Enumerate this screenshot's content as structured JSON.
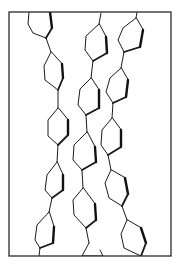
{
  "diagram": {
    "type": "molecular-packing",
    "frame": {
      "x": 9,
      "y": 12,
      "width": 162,
      "height": 244
    },
    "colors": {
      "background": "#ffffff",
      "line": "#1c1c1c"
    },
    "chains": [
      {
        "name": "left-chain",
        "rings": [
          [
            [
              29,
              12
            ],
            [
              28,
              24
            ],
            [
              33,
              33
            ],
            [
              46,
              38
            ],
            [
              52,
              28
            ],
            [
              50,
              12
            ]
          ],
          [
            [
              51,
              52
            ],
            [
              44,
              66
            ],
            [
              45,
              80
            ],
            [
              58,
              90
            ],
            [
              63,
              78
            ],
            [
              62,
              64
            ]
          ],
          [
            [
              58,
              108
            ],
            [
              48,
              120
            ],
            [
              48,
              136
            ],
            [
              58,
              145
            ],
            [
              68,
              135
            ],
            [
              68,
              120
            ]
          ],
          [
            [
              57,
              162
            ],
            [
              47,
              175
            ],
            [
              45,
              190
            ],
            [
              52,
              198
            ],
            [
              63,
              190
            ],
            [
              63,
              175
            ]
          ],
          [
            [
              49,
              212
            ],
            [
              37,
              225
            ],
            [
              35,
              240
            ],
            [
              40,
              248
            ],
            [
              53,
              243
            ],
            [
              54,
              227
            ]
          ]
        ],
        "bonds": [
          [
            [
              46,
              38
            ],
            [
              51,
              52
            ]
          ],
          [
            [
              58,
              90
            ],
            [
              58,
              108
            ]
          ],
          [
            [
              58,
              145
            ],
            [
              57,
              162
            ]
          ],
          [
            [
              52,
              198
            ],
            [
              49,
              212
            ]
          ],
          [
            [
              40,
              248
            ],
            [
              39,
              256
            ]
          ]
        ]
      },
      {
        "name": "middle-chain",
        "rings": [
          [
            [
              99,
              24
            ],
            [
              86,
              36
            ],
            [
              85,
              50
            ],
            [
              93,
              61
            ],
            [
              107,
              53
            ],
            [
              106,
              37
            ]
          ],
          [
            [
              91,
              78
            ],
            [
              80,
              89
            ],
            [
              78,
              105
            ],
            [
              86,
              115
            ],
            [
              99,
              108
            ],
            [
              99,
              90
            ]
          ],
          [
            [
              87,
              132
            ],
            [
              74,
              145
            ],
            [
              73,
              160
            ],
            [
              82,
              170
            ],
            [
              96,
              162
            ],
            [
              95,
              147
            ]
          ],
          [
            [
              83,
              188
            ],
            [
              73,
              200
            ],
            [
              74,
              215
            ],
            [
              86,
              228
            ],
            [
              96,
              220
            ],
            [
              95,
              204
            ]
          ],
          [
            [
              89,
              243
            ],
            [
              82,
              256
            ],
            [
              103,
              256
            ],
            [
              100,
              250
            ]
          ]
        ],
        "bonds": [
          [
            [
              101,
              13
            ],
            [
              99,
              24
            ]
          ],
          [
            [
              93,
              61
            ],
            [
              91,
              78
            ]
          ],
          [
            [
              86,
              115
            ],
            [
              87,
              132
            ]
          ],
          [
            [
              82,
              170
            ],
            [
              83,
              188
            ]
          ],
          [
            [
              86,
              228
            ],
            [
              89,
              243
            ]
          ]
        ]
      },
      {
        "name": "right-chain",
        "rings": [
          [
            [
              136,
              18
            ],
            [
              123,
              28
            ],
            [
              118,
              40
            ],
            [
              124,
              52
            ],
            [
              140,
              47
            ],
            [
              143,
              30
            ]
          ],
          [
            [
              121,
              68
            ],
            [
              110,
              78
            ],
            [
              106,
              92
            ],
            [
              113,
              103
            ],
            [
              126,
              97
            ],
            [
              128,
              80
            ]
          ],
          [
            [
              112,
              118
            ],
            [
              102,
              130
            ],
            [
              101,
              145
            ],
            [
              108,
              155
            ],
            [
              121,
              147
            ],
            [
              121,
              130
            ]
          ],
          [
            [
              111,
              170
            ],
            [
              105,
              183
            ],
            [
              109,
              198
            ],
            [
              122,
              206
            ],
            [
              128,
              194
            ],
            [
              125,
              178
            ]
          ],
          [
            [
              127,
              220
            ],
            [
              121,
              234
            ],
            [
              124,
              248
            ],
            [
              141,
              256
            ],
            [
              146,
              243
            ],
            [
              141,
              228
            ]
          ]
        ],
        "bonds": [
          [
            [
              137,
              12
            ],
            [
              136,
              18
            ]
          ],
          [
            [
              124,
              52
            ],
            [
              121,
              68
            ]
          ],
          [
            [
              113,
              103
            ],
            [
              112,
              118
            ]
          ],
          [
            [
              108,
              155
            ],
            [
              111,
              170
            ]
          ],
          [
            [
              122,
              206
            ],
            [
              127,
              220
            ]
          ]
        ]
      }
    ]
  }
}
